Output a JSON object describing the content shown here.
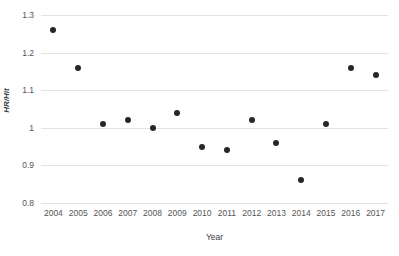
{
  "chart_data": {
    "type": "scatter",
    "title": "",
    "xlabel": "Year",
    "ylabel": "HR/Hit",
    "categories": [
      "2004",
      "2005",
      "2006",
      "2007",
      "2008",
      "2009",
      "2010",
      "2011",
      "2012",
      "2013",
      "2014",
      "2015",
      "2016",
      "2017"
    ],
    "values": [
      1.26,
      1.16,
      1.01,
      1.02,
      1.0,
      1.04,
      0.95,
      0.94,
      1.02,
      0.96,
      0.86,
      1.01,
      1.16,
      1.14
    ],
    "series": [
      {
        "name": "HR/Hit",
        "values": [
          1.26,
          1.16,
          1.01,
          1.02,
          1.0,
          1.04,
          0.95,
          0.94,
          1.02,
          0.96,
          0.86,
          1.01,
          1.16,
          1.14
        ]
      }
    ],
    "ylim": [
      0.8,
      1.3
    ],
    "yticks": [
      "0.8",
      "0.9",
      "1",
      "1.1",
      "1.2",
      "1.3"
    ],
    "ytick_values": [
      0.8,
      0.9,
      1.0,
      1.1,
      1.2,
      1.3
    ],
    "grid": true,
    "grid_axis": "y",
    "legend": "none",
    "marker_color": "#272727",
    "gridline_color": "#e3e3e3",
    "background_color": "#ffffff"
  },
  "axes": {
    "y_title": "HR/Hit",
    "x_title": "Year"
  }
}
